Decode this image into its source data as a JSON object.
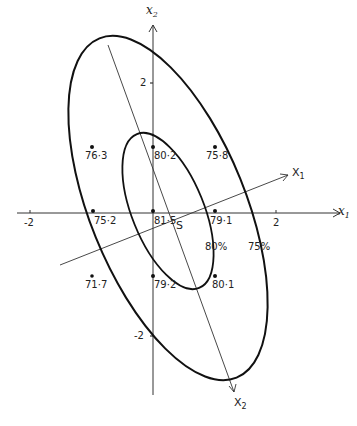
{
  "diagram": {
    "type": "response-surface contour diagram",
    "axes": {
      "x1_label": "x",
      "x1_sub": "1",
      "x2_label": "x",
      "x2_sub": "2",
      "x1_ticks": [
        "-2",
        "2"
      ],
      "x2_ticks": [
        "2",
        "-2"
      ]
    },
    "rotated_axes": {
      "X1_label": "X",
      "X1_sub": "1",
      "X2_label": "X",
      "X2_sub": "2"
    },
    "center_label": "S",
    "contours": [
      {
        "label": "80%"
      },
      {
        "label": "75%"
      }
    ],
    "points": [
      {
        "value": "76·3",
        "x1": -1,
        "x2": 1
      },
      {
        "value": "80·2",
        "x1": 0,
        "x2": 1
      },
      {
        "value": "75·8",
        "x1": 1,
        "x2": 1
      },
      {
        "value": "75·2",
        "x1": -1,
        "x2": 0
      },
      {
        "value": "81·5",
        "x1": 0,
        "x2": 0
      },
      {
        "value": "79·1",
        "x1": 1,
        "x2": 0
      },
      {
        "value": "71·7",
        "x1": -1,
        "x2": -1
      },
      {
        "value": "79·2",
        "x1": 0,
        "x2": -1
      },
      {
        "value": "80·1",
        "x1": 1,
        "x2": -1
      }
    ]
  }
}
